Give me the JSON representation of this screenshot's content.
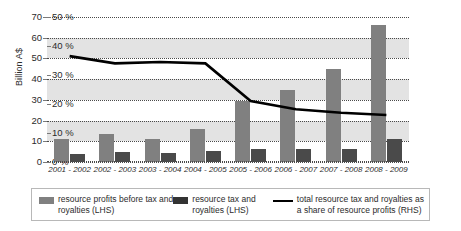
{
  "chart_data": {
    "type": "bar",
    "title": "",
    "subtitle": "",
    "xlabel": "",
    "ylabel": "Billion A$",
    "y2label": "",
    "categories": [
      "2001 - 2002",
      "2002 - 2003",
      "2003 - 2004",
      "2004 - 2005",
      "2005 - 2006",
      "2006 - 2007",
      "2007 - 2008",
      "2008 - 2009"
    ],
    "ylim": [
      0,
      70
    ],
    "y2lim": [
      0,
      50
    ],
    "yticks": [
      0,
      10,
      20,
      30,
      40,
      50,
      60,
      70
    ],
    "ytick_labels": [
      "0",
      "10",
      "20",
      "30",
      "40",
      "50",
      "60",
      "70"
    ],
    "y2ticks": [
      0,
      10,
      20,
      30,
      40,
      50
    ],
    "y2tick_labels": [
      "0 %",
      "10 %",
      "20 %",
      "30 %",
      "40 %",
      "50 %"
    ],
    "grid": true,
    "legend_position": "bottom",
    "series": [
      {
        "name": "resource profits before tax and royalties (LHS)",
        "type": "bar",
        "axis": "left",
        "color": "#808080",
        "values": [
          11.2,
          13.6,
          11.0,
          16.0,
          29.5,
          35.0,
          45.0,
          66.0
        ]
      },
      {
        "name": "resource tax and royalties (LHS)",
        "type": "bar",
        "axis": "left",
        "color": "#4a4a4a",
        "values": [
          4.0,
          4.7,
          4.2,
          5.3,
          6.4,
          6.4,
          6.5,
          11.0
        ]
      },
      {
        "name": "total resource tax and royalties as a share of resource profits (RHS)",
        "type": "line",
        "axis": "right",
        "color": "#000000",
        "values": [
          36.5,
          34.0,
          34.5,
          34.0,
          21.0,
          18.2,
          17.0,
          16.2
        ]
      }
    ]
  },
  "legend": {
    "entries": [
      {
        "label": "resource profits before tax and royalties (LHS)",
        "marker": "box",
        "color": "#808080"
      },
      {
        "label": "resource tax and royalties (LHS)",
        "marker": "box",
        "color": "#333333"
      },
      {
        "label": "total resource tax and royalties as a share of resource profits (RHS)",
        "marker": "line",
        "color": "#000000"
      }
    ]
  }
}
